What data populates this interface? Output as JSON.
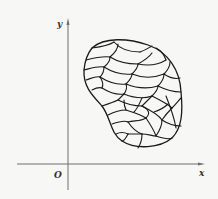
{
  "diagram": {
    "axes": {
      "x_label": "x",
      "y_label": "y",
      "origin_label": "O"
    },
    "colors": {
      "background": "#f7f7f5",
      "axis": "#6e6e6e",
      "region_outline": "#1a1a1a"
    }
  }
}
